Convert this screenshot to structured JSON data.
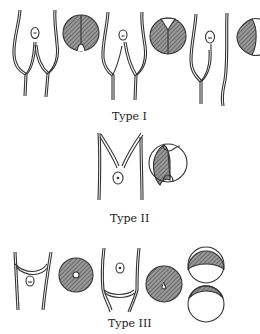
{
  "figure": {
    "background": "#ffffff",
    "ink": "#333333",
    "hatch_color": "#555555"
  },
  "labels": {
    "type1": "Type I",
    "type2": "Type II",
    "type3": "Type III"
  },
  "groups": [
    {
      "label": "Type I",
      "items": [
        "paired-fork-with-oval",
        "hatched-circle-split-notch-bottom",
        "fork-with-oval",
        "hatched-circle-split-notch-top",
        "fork-with-oval-and-single-strand",
        "hatched-lens-partial-circle"
      ]
    },
    {
      "label": "Type II",
      "items": [
        "v-fork-with-oval",
        "circle-half-hatched-with-bottom-notch"
      ]
    },
    {
      "label": "Type III",
      "items": [
        "u-cup-with-oval",
        "hatched-ring-with-center-hole",
        "u-cup-with-oval",
        "hatched-circle-with-small-mark",
        "stacked-circles-top-hatched"
      ]
    }
  ]
}
